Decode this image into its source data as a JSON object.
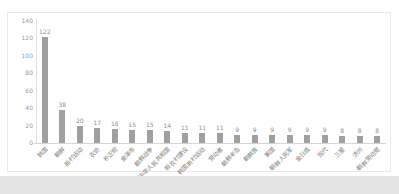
{
  "page": {
    "background_color": "#ffffff",
    "footer_strip_color": "#e5e5e5",
    "panel_border_color": "#e9e9e9"
  },
  "chart_data": {
    "type": "bar",
    "title": "",
    "xlabel": "",
    "ylabel": "",
    "categories": [
      "韩国",
      "朝鲜",
      "新村运动",
      "农协",
      "朴正熙",
      "金泽市",
      "朝鲜战争",
      "中华人民共和国",
      "新农村建设",
      "韩国新村运动",
      "劳动者",
      "朝鲜半岛",
      "朝鲜族",
      "美国",
      "朝鲜人民军",
      "金日成",
      "现代",
      "三星",
      "济州",
      "朝鲜劳动党"
    ],
    "values": [
      122,
      38,
      20,
      17,
      16,
      15,
      15,
      14,
      11,
      11,
      11,
      9,
      9,
      9,
      9,
      9,
      9,
      8,
      8,
      8
    ],
    "value_labels_shown": true,
    "ylim": [
      0,
      140
    ],
    "yticks": [
      0,
      20,
      40,
      60,
      80,
      100,
      120,
      140
    ],
    "x_tick_rotation_deg": 45,
    "grid": false,
    "legend": false,
    "bar_color": "#a0a0a0",
    "value_label_color": "#8f8f8f",
    "tick_label_color": "#9a9a9a",
    "axis_color": "#d6d6d6"
  }
}
